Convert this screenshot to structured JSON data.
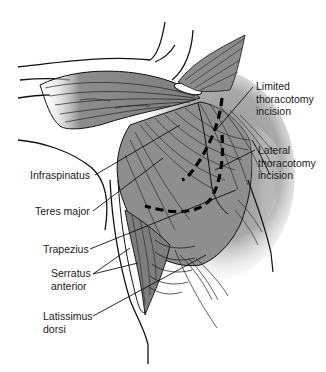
{
  "figure": {
    "colors": {
      "muscle_fill": "#8a8a8a",
      "muscle_dark": "#5e5e5e",
      "outline": "#111111",
      "background": "#ffffff",
      "tendon": "#ffffff"
    },
    "labels": {
      "limited_incision": [
        "Limited",
        "thoracotomy",
        "incision"
      ],
      "lateral_incision": [
        "Lateral",
        "thoracotomy",
        "incision"
      ],
      "infraspinatus": "Infraspinatus",
      "teres_major": "Teres major",
      "trapezius": "Trapezius",
      "serratus_anterior": [
        "Serratus",
        "anterior"
      ],
      "latissimus_dorsi": [
        "Latissimus",
        "dorsi"
      ]
    }
  }
}
